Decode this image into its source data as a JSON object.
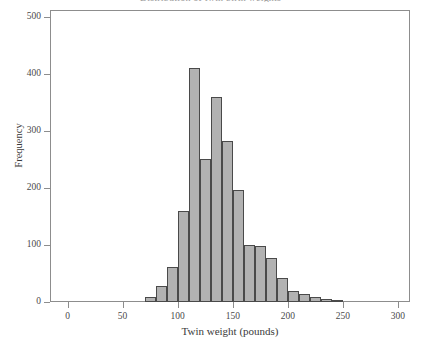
{
  "figure": {
    "title_clipped": "Distribution of twin birth weights",
    "background_color": "#ffffff",
    "frame_color": "#8d8d8d"
  },
  "style": {
    "bar_fill": "#b2b2b2",
    "bar_edge": "#4a4a4a",
    "text_color": "#3a3a3a"
  },
  "chart_data": {
    "type": "bar",
    "title": "Distribution of twin birth weights",
    "xlabel": "Twin weight (pounds)",
    "ylabel": "Frequency",
    "xlim": [
      -15,
      310
    ],
    "ylim": [
      0,
      510
    ],
    "grid": false,
    "legend": null,
    "bin_width": 10,
    "xticks": [
      0,
      50,
      100,
      150,
      200,
      250,
      300
    ],
    "xtick_labels": [
      "0",
      "50",
      "100",
      "150",
      "200",
      "250",
      "300"
    ],
    "yticks": [
      0,
      100,
      200,
      300,
      400,
      500
    ],
    "ytick_labels": [
      "0",
      "100",
      "200",
      "300",
      "400",
      "500"
    ],
    "bin_starts": [
      70,
      80,
      90,
      100,
      110,
      120,
      130,
      140,
      150,
      160,
      170,
      180,
      190,
      200,
      210,
      220,
      230,
      240
    ],
    "bin_centers": [
      75,
      85,
      95,
      105,
      115,
      125,
      135,
      145,
      155,
      165,
      175,
      185,
      195,
      205,
      215,
      225,
      235,
      245
    ],
    "categories": [
      "70-80",
      "80-90",
      "90-100",
      "100-110",
      "110-120",
      "120-130",
      "130-140",
      "140-150",
      "150-160",
      "160-170",
      "170-180",
      "180-190",
      "190-200",
      "200-210",
      "210-220",
      "220-230",
      "230-240",
      "240-250"
    ],
    "values": [
      8,
      28,
      62,
      160,
      410,
      250,
      360,
      282,
      196,
      100,
      98,
      78,
      42,
      20,
      14,
      8,
      5,
      3
    ]
  }
}
